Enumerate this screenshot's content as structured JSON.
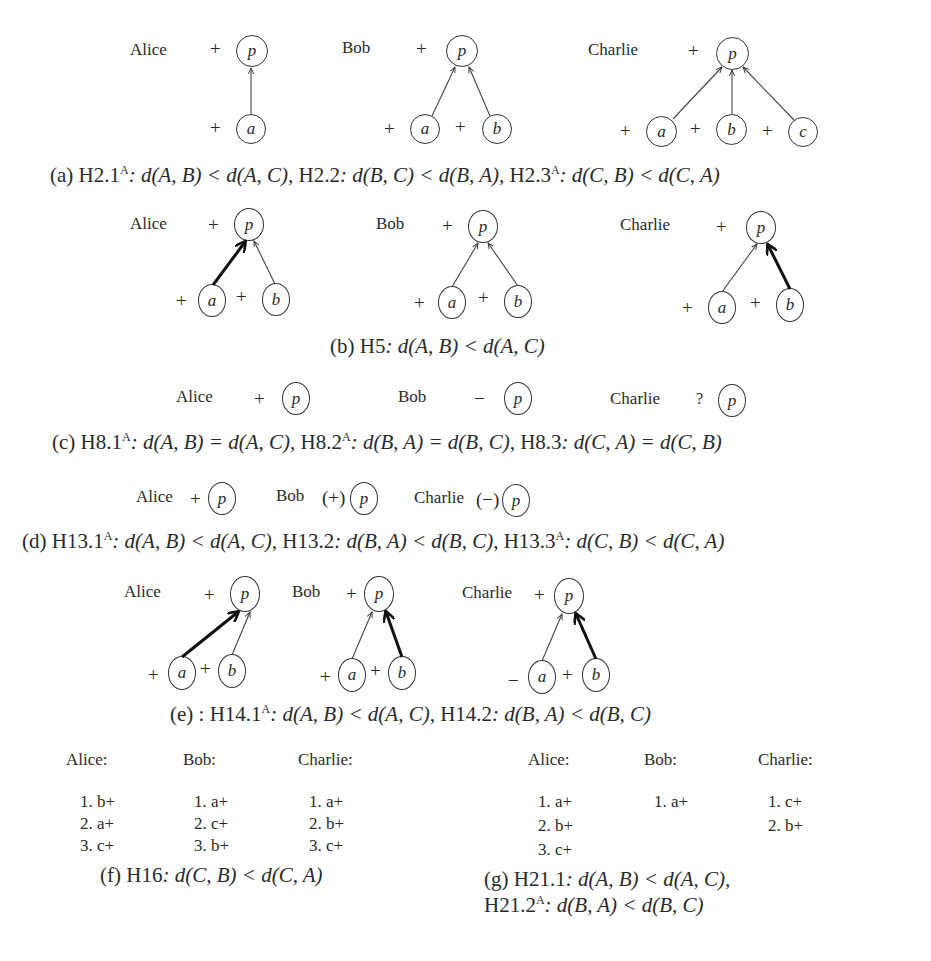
{
  "figure": {
    "panels": [
      {
        "id": "a",
        "agents": [
          {
            "name": "Alice",
            "p_sign": "+",
            "parents": [
              {
                "label": "a",
                "sign": "+",
                "edge": "thin"
              }
            ]
          },
          {
            "name": "Bob",
            "p_sign": "+",
            "parents": [
              {
                "label": "a",
                "sign": "+",
                "edge": "thin"
              },
              {
                "label": "b",
                "sign": "+",
                "edge": "thin"
              }
            ]
          },
          {
            "name": "Charlie",
            "p_sign": "+",
            "parents": [
              {
                "label": "a",
                "sign": "+",
                "edge": "thin"
              },
              {
                "label": "b",
                "sign": "+",
                "edge": "thin"
              },
              {
                "label": "c",
                "sign": "+",
                "edge": "thin"
              }
            ]
          }
        ],
        "caption": "(a) H2.1ᴬ: d(A, B) < d(A, C), H2.2: d(B, C) < d(B, A), H2.3ᴬ: d(C, B) < d(C, A)",
        "caption_parts": {
          "prefix": "(a) ",
          "h1": "H2.1",
          "h1_sup": "A",
          "h1_eq": ": d(A, B) < d(A, C), ",
          "h2": "H2.2",
          "h2_eq": ": d(B, C) < d(B, A), ",
          "h3": "H2.3",
          "h3_sup": "A",
          "h3_eq": ": d(C, B) < d(C, A)"
        }
      },
      {
        "id": "b",
        "agents": [
          {
            "name": "Alice",
            "p_sign": "+",
            "parents": [
              {
                "label": "a",
                "sign": "+",
                "edge": "thick"
              },
              {
                "label": "b",
                "sign": "+",
                "edge": "thin"
              }
            ]
          },
          {
            "name": "Bob",
            "p_sign": "+",
            "parents": [
              {
                "label": "a",
                "sign": "+",
                "edge": "thin"
              },
              {
                "label": "b",
                "sign": "+",
                "edge": "thin"
              }
            ]
          },
          {
            "name": "Charlie",
            "p_sign": "+",
            "parents": [
              {
                "label": "a",
                "sign": "+",
                "edge": "thin"
              },
              {
                "label": "b",
                "sign": "+",
                "edge": "thick"
              }
            ]
          }
        ],
        "caption": "(b) H5: d(A, B) < d(A, C)",
        "caption_parts": {
          "prefix": "(b) ",
          "h1": "H5",
          "h1_eq": ": d(A, B) < d(A, C)"
        }
      },
      {
        "id": "c",
        "agents": [
          {
            "name": "Alice",
            "p_sign": "+"
          },
          {
            "name": "Bob",
            "p_sign": "−"
          },
          {
            "name": "Charlie",
            "p_sign": "?"
          }
        ],
        "caption": "(c) H8.1ᴬ: d(A, B) = d(A, C), H8.2ᴬ: d(B, A) = d(B, C), H8.3: d(C, A) = d(C, B)",
        "caption_parts": {
          "prefix": "(c) ",
          "h1": "H8.1",
          "h1_sup": "A",
          "h1_eq": ": d(A, B) = d(A, C), ",
          "h2": "H8.2",
          "h2_sup": "A",
          "h2_eq": ": d(B, A) = d(B, C), ",
          "h3": "H8.3",
          "h3_eq": ": d(C, A) = d(C, B)"
        }
      },
      {
        "id": "d",
        "agents": [
          {
            "name": "Alice",
            "p_sign": "+"
          },
          {
            "name": "Bob",
            "p_sign": "(+)"
          },
          {
            "name": "Charlie",
            "p_sign": "(−)"
          }
        ],
        "caption": "(d) H13.1ᴬ: d(A, B) < d(A, C), H13.2: d(B, A) < d(B, C), H13.3ᴬ: d(C, B) < d(C, A)",
        "caption_parts": {
          "prefix": "(d) ",
          "h1": "H13.1",
          "h1_sup": "A",
          "h1_eq": ": d(A, B) < d(A, C), ",
          "h2": "H13.2",
          "h2_eq": ": d(B, A) < d(B, C), ",
          "h3": "H13.3",
          "h3_sup": "A",
          "h3_eq": ": d(C, B) < d(C, A)"
        }
      },
      {
        "id": "e",
        "agents": [
          {
            "name": "Alice",
            "p_sign": "+",
            "parents": [
              {
                "label": "a",
                "sign": "+",
                "edge": "thick"
              },
              {
                "label": "b",
                "sign": "+",
                "edge": "thin"
              }
            ]
          },
          {
            "name": "Bob",
            "p_sign": "+",
            "parents": [
              {
                "label": "a",
                "sign": "+",
                "edge": "thin"
              },
              {
                "label": "b",
                "sign": "+",
                "edge": "thick"
              }
            ]
          },
          {
            "name": "Charlie",
            "p_sign": "+",
            "parents": [
              {
                "label": "a",
                "sign": "−",
                "edge": "thin"
              },
              {
                "label": "b",
                "sign": "+",
                "edge": "thick"
              }
            ]
          }
        ],
        "caption": "(e) : H14.1ᴬ: d(A, B) < d(A, C), H14.2: d(B, A) < d(B, C)",
        "caption_parts": {
          "prefix": "(e) : ",
          "h1": "H14.1",
          "h1_sup": "A",
          "h1_eq": ": d(A, B) < d(A, C), ",
          "h2": "H14.2",
          "h2_eq": ": d(B, A) < d(B, C)"
        }
      },
      {
        "id": "f",
        "lists": [
          {
            "name": "Alice:",
            "items": [
              "1.  b+",
              "2.  a+",
              "3.  c+"
            ]
          },
          {
            "name": "Bob:",
            "items": [
              "1.  a+",
              "2.  c+",
              "3.  b+"
            ]
          },
          {
            "name": "Charlie:",
            "items": [
              "1.  a+",
              "2.  b+",
              "3.  c+"
            ]
          }
        ],
        "caption": "(f) H16: d(C, B) < d(C, A)",
        "caption_parts": {
          "prefix": "(f) ",
          "h1": "H16",
          "h1_eq": ": d(C, B) < d(C, A)"
        }
      },
      {
        "id": "g",
        "lists": [
          {
            "name": "Alice:",
            "items": [
              "1.  a+",
              "2.  b+",
              "3.  c+"
            ]
          },
          {
            "name": "Bob:",
            "items": [
              "1.  a+"
            ]
          },
          {
            "name": "Charlie:",
            "items": [
              "1.  c+",
              "2.  b+"
            ]
          }
        ],
        "caption": "(g) H21.1: d(A, B) < d(A, C), H21.2ᴬ: d(B, A) < d(B, C)",
        "caption_parts": {
          "line1_prefix": "(g) ",
          "h1": "H21.1",
          "h1_eq": ": d(A, B) < d(A, C),",
          "h2": "H21.2",
          "h2_sup": "A",
          "h2_eq": ": d(B, A) < d(B, C)"
        }
      }
    ],
    "node_labels": {
      "p": "p",
      "a": "a",
      "b": "b",
      "c": "c"
    }
  }
}
